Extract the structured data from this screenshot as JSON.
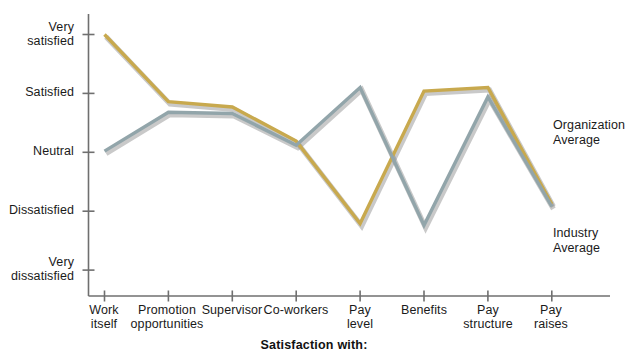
{
  "chart_data": {
    "type": "line",
    "title": "",
    "subtitle": "",
    "xlabel": "Satisfaction with:",
    "ylabel": "",
    "grid": false,
    "legend_position": "right-inline",
    "categories": [
      "Work itself",
      "Promotion opportunities",
      "Supervisor",
      "Co-workers",
      "Pay level",
      "Benefits",
      "Pay structure",
      "Pay raises"
    ],
    "category_lines": [
      [
        "Work",
        "itself"
      ],
      [
        "Promotion",
        "opportunities"
      ],
      [
        "Supervisor"
      ],
      [
        "Co-workers"
      ],
      [
        "Pay",
        "level"
      ],
      [
        "Benefits"
      ],
      [
        "Pay",
        "structure"
      ],
      [
        "Pay",
        "raises"
      ]
    ],
    "y_tick_labels": [
      "Very satisfied",
      "Satisfied",
      "Neutral",
      "Dissatisfied",
      "Very dissatisfied"
    ],
    "y_tick_lines": [
      [
        "Very",
        "satisfied"
      ],
      [
        "Satisfied"
      ],
      [
        "Neutral"
      ],
      [
        "Dissatisfied"
      ],
      [
        "Very",
        "dissatisfied"
      ]
    ],
    "y_tick_values": [
      5,
      4,
      3,
      2,
      1
    ],
    "ylim": [
      1,
      5
    ],
    "series": [
      {
        "name": "Organization Average",
        "color": "#c8a94e",
        "values": [
          5.0,
          3.86,
          3.77,
          3.19,
          1.79,
          4.04,
          4.1,
          2.12
        ]
      },
      {
        "name": "Industry Average",
        "color": "#92a5aa",
        "values": [
          3.02,
          3.68,
          3.66,
          3.12,
          4.1,
          1.76,
          3.94,
          2.08
        ]
      }
    ],
    "annotations": [
      {
        "text": "Organization Average",
        "target_series": "Organization Average"
      },
      {
        "text": "Industry Average",
        "target_series": "Industry Average"
      }
    ]
  },
  "legend": {
    "organization": {
      "line1": "Organization",
      "line2": "Average"
    },
    "industry": {
      "line1": "Industry",
      "line2": "Average"
    }
  },
  "axis": {
    "x_title": "Satisfaction with:",
    "axis_color": "#6f6f6f"
  }
}
